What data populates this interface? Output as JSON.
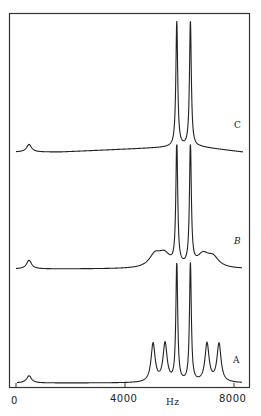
{
  "chart_data": {
    "type": "line",
    "title": "",
    "xlabel": "Hz",
    "ylabel": "",
    "xlim": [
      0,
      8500
    ],
    "x_ticks": [
      0,
      4000,
      8000
    ],
    "x_tick_labels": [
      "0",
      "4000",
      "8000"
    ],
    "grid": false,
    "legend": null,
    "series": [
      {
        "name": "A",
        "peaks_hz": [
          480,
          5030,
          5470,
          5900,
          6400,
          7010,
          7450
        ],
        "relative_heights": [
          0.06,
          0.32,
          0.32,
          1.0,
          1.0,
          0.32,
          0.32
        ],
        "description": "small peak near 500 Hz; two tall central lines with two flanking satellite lines on each side"
      },
      {
        "name": "B",
        "peaks_hz": [
          480,
          5100,
          5450,
          5900,
          6400,
          6860,
          7230
        ],
        "relative_heights": [
          0.07,
          0.1,
          0.1,
          1.0,
          1.0,
          0.1,
          0.08
        ],
        "description": "small peak near 500 Hz; two tall central lines with broadened, low satellite humps"
      },
      {
        "name": "C",
        "peaks_hz": [
          480,
          5900,
          6400
        ],
        "relative_heights": [
          0.06,
          1.0,
          1.0
        ],
        "description": "small peak near 500 Hz; only two tall central lines, satellites absent"
      }
    ],
    "annotations": [
      "A",
      "B",
      "C"
    ]
  },
  "labels": {
    "trace_a": "A",
    "trace_b": "B",
    "trace_c": "C",
    "x_unit": "Hz",
    "tick_0": "0",
    "tick_4000": "4000",
    "tick_8000": "8000"
  }
}
